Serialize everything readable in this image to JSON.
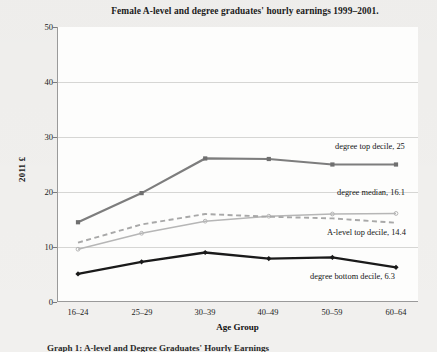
{
  "chart_data": {
    "type": "line",
    "title": "Female A-level and degree graduates' hourly earnings 1999–2001.",
    "xlabel": "Age Group",
    "ylabel": "2011 £",
    "categories": [
      "16–24",
      "25–29",
      "30–39",
      "40–49",
      "50–59",
      "60–64"
    ],
    "ylim": [
      0,
      50
    ],
    "yticks": [
      0,
      10,
      20,
      30,
      40,
      50
    ],
    "grid": true,
    "legend": "inline-right-labels",
    "series": [
      {
        "name": "degree top decile",
        "end_label": "degree top decile, 25",
        "end_value": 25,
        "color": "#7d7d7d",
        "style": "solid-marker",
        "values": [
          14.5,
          19.8,
          26.1,
          26.0,
          25.0,
          25.0
        ]
      },
      {
        "name": "degree median",
        "end_label": "degree median, 16.1",
        "end_value": 16.1,
        "color": "#b6b6b6",
        "style": "solid-thin",
        "values": [
          9.6,
          12.5,
          14.7,
          15.6,
          16.0,
          16.1
        ]
      },
      {
        "name": "A-level top decile",
        "end_label": "A-level top decile, 14.4",
        "end_value": 14.4,
        "color": "#a8a8a8",
        "style": "dashed",
        "values": [
          10.8,
          14.1,
          16.0,
          15.5,
          15.2,
          14.4
        ]
      },
      {
        "name": "degree bottom decile",
        "end_label": "degree bottom decile, 6.3",
        "end_value": 6.3,
        "color": "#1a1a1a",
        "style": "solid-bold-marker",
        "values": [
          5.1,
          7.3,
          9.0,
          7.9,
          8.1,
          6.3
        ]
      }
    ],
    "annotations": [
      {
        "text": "degree top decile, 25",
        "anchor_series": "degree top decile"
      },
      {
        "text": "degree median, 16.1",
        "anchor_series": "degree median"
      },
      {
        "text": "A-level top decile, 14.4",
        "anchor_series": "A-level top decile"
      },
      {
        "text": "degree bottom decile, 6.3",
        "anchor_series": "degree bottom decile"
      }
    ]
  },
  "axis": {
    "y_tick_labels": [
      "50",
      "40",
      "30",
      "20",
      "10",
      "0"
    ],
    "x_tick_labels": [
      "16–24",
      "25–29",
      "30–39",
      "40–49",
      "50–59",
      "60–64"
    ],
    "y_title": "2011 £",
    "x_title": "Age Group"
  },
  "caption": {
    "text": "Graph 1: A-level and Degree Graduates' Hourly Earnings"
  }
}
